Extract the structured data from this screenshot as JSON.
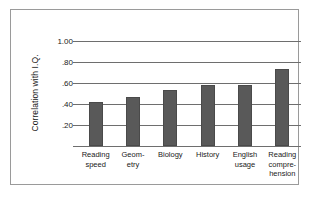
{
  "chart_data": {
    "type": "bar",
    "title": "",
    "xlabel": "",
    "ylabel": "Correlation with I.Q.",
    "categories": [
      "Reading\nspeed",
      "Geom-\netry",
      "Biology",
      "History",
      "English\nusage",
      "Reading\ncompre-\nhension"
    ],
    "values": [
      0.42,
      0.47,
      0.53,
      0.58,
      0.58,
      0.73
    ],
    "ylim": [
      0.0,
      1.0
    ],
    "yticks": [
      1.0,
      0.8,
      0.6,
      0.4,
      0.2
    ],
    "ytick_labels": [
      "1.00",
      ".80",
      ".60",
      ".40",
      ".20"
    ],
    "grid": true,
    "legend": false,
    "bar_color": "#595959",
    "gridline_color": "#6e6e6e",
    "frame_color": "#9a9a9a",
    "background": "#ffffff"
  }
}
